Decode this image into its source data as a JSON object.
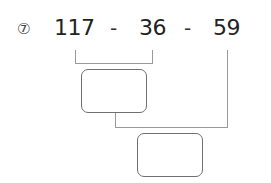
{
  "problem": {
    "marker": "⑦",
    "operand1": "117",
    "operator1": "-",
    "operand2": "36",
    "operator2": "-",
    "operand3": "59"
  },
  "answer_boxes": [
    {
      "value": ""
    },
    {
      "value": ""
    }
  ]
}
